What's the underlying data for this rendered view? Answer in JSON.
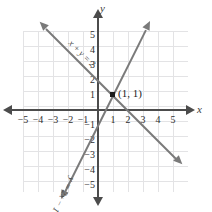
{
  "figure": {
    "axis_x_name": "x",
    "axis_y_name": "y"
  },
  "chart_data": {
    "type": "line",
    "title": "",
    "xlabel": "x",
    "ylabel": "y",
    "xlim": [
      -5.8,
      6.0
    ],
    "ylim": [
      -5.9,
      5.8
    ],
    "grid": true,
    "legend": "inline-labels",
    "xticks": [
      -5,
      -4,
      -3,
      -2,
      -1,
      1,
      2,
      3,
      4,
      5
    ],
    "xtick_labels": [
      "-5",
      "-4",
      "-3",
      "-2",
      "-1",
      "1",
      "2",
      "3",
      "4",
      "5"
    ],
    "yticks": [
      5,
      4,
      3,
      2,
      1,
      -1,
      -2,
      -3,
      -4,
      -5
    ],
    "ytick_labels": [
      "5",
      "4",
      "3",
      "2",
      "1",
      "-1",
      "-2",
      "-3",
      "-4",
      "-5"
    ],
    "series": [
      {
        "name": "x + y = 2",
        "label": "x + y = 2",
        "slope": -1,
        "intercept": 2,
        "color": "#7a7a7a",
        "points": [
          [
            -3.5,
            5.5
          ],
          [
            5.2,
            -3.2
          ]
        ]
      },
      {
        "name": "y = 2x - 1",
        "label": "y = 2x - 1",
        "slope": 2,
        "intercept": -1,
        "color": "#7a7a7a",
        "points": [
          [
            -2.2,
            -5.4
          ],
          [
            3.2,
            5.4
          ]
        ]
      }
    ],
    "annotations": [
      {
        "name": "intersection",
        "label": "(1, 1)",
        "x": 1,
        "y": 1,
        "marker": "square-dot",
        "color": "#1c1c1c"
      }
    ]
  },
  "colors": {
    "grid": "#e3e3e5",
    "axis": "#4c4c4c",
    "line": "#7a7a7a",
    "text": "#2e2e2e",
    "point": "#1c1c1c"
  }
}
